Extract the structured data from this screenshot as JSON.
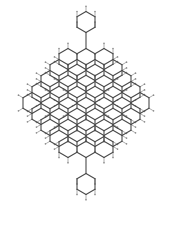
{
  "figure": {
    "name": "polycyclic-aromatic-hydrocarbon-structure",
    "kind": "chemical-structure-diagram",
    "background_color": "#ffffff",
    "bond_color": "#4a4a4a",
    "hydrogen_label_color": "#8a8a8a",
    "bond_width_px": 1.1,
    "hydrogen_stub_width_px": 0.7
  },
  "lattice": {
    "orientation": "pointy-top",
    "hex_width_px": 18.0,
    "hex_height_px": 21.0,
    "ring_count": 41,
    "row_ring_counts": [
      1,
      3,
      4,
      5,
      6,
      7,
      6,
      5,
      4,
      3,
      1
    ],
    "row_center_y": [
      22,
      59,
      70,
      81,
      92,
      103,
      114,
      125,
      136,
      147,
      184
    ],
    "center_x": 86
  },
  "rings": [
    {
      "id": "R0",
      "row": 0,
      "cx": 86,
      "cy": 22,
      "type": "pendant-top"
    },
    {
      "id": "R1",
      "row": 1,
      "cx": 68,
      "cy": 59,
      "type": "fused"
    },
    {
      "id": "R2",
      "row": 1,
      "cx": 86,
      "cy": 59,
      "type": "fused"
    },
    {
      "id": "R3",
      "row": 1,
      "cx": 104,
      "cy": 59,
      "type": "fused"
    },
    {
      "id": "R4",
      "row": 2,
      "cx": 59,
      "cy": 70,
      "type": "fused"
    },
    {
      "id": "R5",
      "row": 2,
      "cx": 77,
      "cy": 70,
      "type": "fused"
    },
    {
      "id": "R6",
      "row": 2,
      "cx": 95,
      "cy": 70,
      "type": "fused"
    },
    {
      "id": "R7",
      "row": 2,
      "cx": 113,
      "cy": 70,
      "type": "fused"
    },
    {
      "id": "R8",
      "row": 3,
      "cx": 50,
      "cy": 81,
      "type": "fused"
    },
    {
      "id": "R9",
      "row": 3,
      "cx": 68,
      "cy": 81,
      "type": "fused"
    },
    {
      "id": "R10",
      "row": 3,
      "cx": 86,
      "cy": 81,
      "type": "fused"
    },
    {
      "id": "R11",
      "row": 3,
      "cx": 104,
      "cy": 81,
      "type": "fused"
    },
    {
      "id": "R12",
      "row": 3,
      "cx": 122,
      "cy": 81,
      "type": "fused"
    },
    {
      "id": "R13",
      "row": 4,
      "cx": 41,
      "cy": 92,
      "type": "fused"
    },
    {
      "id": "R14",
      "row": 4,
      "cx": 59,
      "cy": 92,
      "type": "fused"
    },
    {
      "id": "R15",
      "row": 4,
      "cx": 77,
      "cy": 92,
      "type": "fused"
    },
    {
      "id": "R16",
      "row": 4,
      "cx": 95,
      "cy": 92,
      "type": "fused"
    },
    {
      "id": "R17",
      "row": 4,
      "cx": 113,
      "cy": 92,
      "type": "fused"
    },
    {
      "id": "R18",
      "row": 4,
      "cx": 131,
      "cy": 92,
      "type": "fused"
    },
    {
      "id": "R19",
      "row": 5,
      "cx": 32,
      "cy": 103,
      "type": "fused"
    },
    {
      "id": "R20",
      "row": 5,
      "cx": 50,
      "cy": 103,
      "type": "fused"
    },
    {
      "id": "R21",
      "row": 5,
      "cx": 68,
      "cy": 103,
      "type": "fused"
    },
    {
      "id": "R22",
      "row": 5,
      "cx": 86,
      "cy": 103,
      "type": "fused"
    },
    {
      "id": "R23",
      "row": 5,
      "cx": 104,
      "cy": 103,
      "type": "fused"
    },
    {
      "id": "R24",
      "row": 5,
      "cx": 122,
      "cy": 103,
      "type": "fused"
    },
    {
      "id": "R25",
      "row": 5,
      "cx": 140,
      "cy": 103,
      "type": "fused"
    },
    {
      "id": "R26",
      "row": 6,
      "cx": 41,
      "cy": 114,
      "type": "fused"
    },
    {
      "id": "R27",
      "row": 6,
      "cx": 59,
      "cy": 114,
      "type": "fused"
    },
    {
      "id": "R28",
      "row": 6,
      "cx": 77,
      "cy": 114,
      "type": "fused"
    },
    {
      "id": "R29",
      "row": 6,
      "cx": 95,
      "cy": 114,
      "type": "fused"
    },
    {
      "id": "R30",
      "row": 6,
      "cx": 113,
      "cy": 114,
      "type": "fused"
    },
    {
      "id": "R31",
      "row": 6,
      "cx": 131,
      "cy": 114,
      "type": "fused"
    },
    {
      "id": "R32",
      "row": 7,
      "cx": 50,
      "cy": 125,
      "type": "fused"
    },
    {
      "id": "R33",
      "row": 7,
      "cx": 68,
      "cy": 125,
      "type": "fused"
    },
    {
      "id": "R34",
      "row": 7,
      "cx": 86,
      "cy": 125,
      "type": "fused"
    },
    {
      "id": "R35",
      "row": 7,
      "cx": 104,
      "cy": 125,
      "type": "fused"
    },
    {
      "id": "R36",
      "row": 7,
      "cx": 122,
      "cy": 125,
      "type": "fused"
    },
    {
      "id": "R37",
      "row": 8,
      "cx": 59,
      "cy": 136,
      "type": "fused"
    },
    {
      "id": "R38",
      "row": 8,
      "cx": 77,
      "cy": 136,
      "type": "fused"
    },
    {
      "id": "R39",
      "row": 8,
      "cx": 95,
      "cy": 136,
      "type": "fused"
    },
    {
      "id": "R40",
      "row": 8,
      "cx": 113,
      "cy": 136,
      "type": "fused"
    },
    {
      "id": "R41",
      "row": 9,
      "cx": 68,
      "cy": 147,
      "type": "fused"
    },
    {
      "id": "R42",
      "row": 9,
      "cx": 86,
      "cy": 147,
      "type": "fused"
    },
    {
      "id": "R43",
      "row": 9,
      "cx": 104,
      "cy": 147,
      "type": "fused"
    },
    {
      "id": "R44",
      "row": 10,
      "cx": 86,
      "cy": 184,
      "type": "pendant-bottom"
    }
  ],
  "pendant_bonds": [
    {
      "id": "B-top",
      "x1": 86,
      "y1": 32.5,
      "x2": 86,
      "y2": 48.5,
      "label": "top-single-bond"
    },
    {
      "id": "B-bottom",
      "x1": 86,
      "y1": 157.5,
      "x2": 86,
      "y2": 173.5,
      "label": "bottom-single-bond"
    }
  ]
}
